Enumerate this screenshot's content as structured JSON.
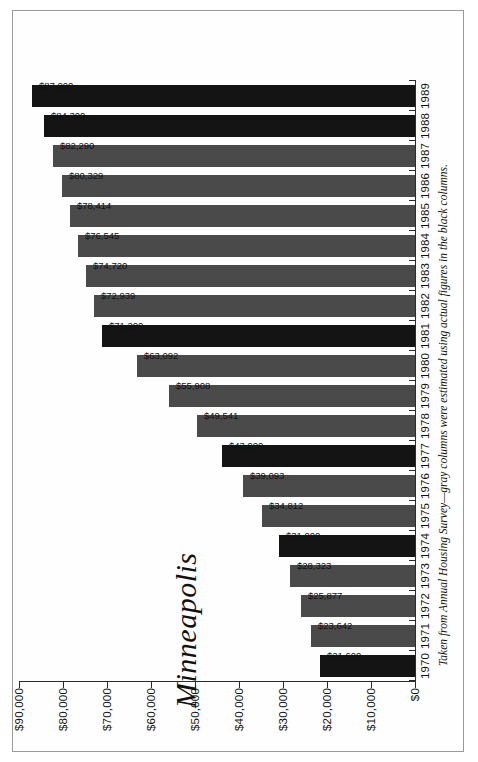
{
  "chart_data": {
    "type": "bar",
    "orientation": "vertical",
    "title": "Minneapolis",
    "xlabel": "",
    "ylabel": "",
    "ylim": [
      0,
      90000
    ],
    "grid": false,
    "legend": "none",
    "footnote": "Taken from Annual Housing Survey—gray columns were estimated using actual figures in the black columns.",
    "y_tick_labels": [
      "$90,000",
      "$80,000",
      "$70,000",
      "$60,000",
      "$50,000",
      "$40,000",
      "$30,000",
      "$20,000",
      "$10,000",
      "$0"
    ],
    "y_tick_values": [
      90000,
      80000,
      70000,
      60000,
      50000,
      40000,
      30000,
      20000,
      10000,
      0
    ],
    "categories": [
      "1970",
      "1971",
      "1972",
      "1973",
      "1974",
      "1975",
      "1976",
      "1977",
      "1978",
      "1979",
      "1980",
      "1981",
      "1982",
      "1983",
      "1984",
      "1985",
      "1986",
      "1987",
      "1988",
      "1989"
    ],
    "values": [
      21600,
      23642,
      25877,
      28323,
      31000,
      34812,
      39093,
      43900,
      49541,
      55908,
      63092,
      71200,
      72939,
      74720,
      76545,
      78414,
      80329,
      82290,
      84300,
      87000
    ],
    "value_labels": [
      "$21,600",
      "$23,642",
      "$25,877",
      "$28,323",
      "$31,000",
      "$34,812",
      "$39,093",
      "$43,900",
      "$49,541",
      "$55,908",
      "$63,092",
      "$71,200",
      "$72,939",
      "$74,720",
      "$76,545",
      "$78,414",
      "$80,329",
      "$82,290",
      "$84,300",
      "$87,000"
    ],
    "bar_kinds": [
      "actual",
      "estimated",
      "estimated",
      "estimated",
      "actual",
      "estimated",
      "estimated",
      "actual",
      "estimated",
      "estimated",
      "estimated",
      "actual",
      "estimated",
      "estimated",
      "estimated",
      "estimated",
      "estimated",
      "estimated",
      "actual",
      "actual"
    ],
    "colors": {
      "actual": "#141414",
      "estimated": "#4a4a4a",
      "axis": "#2b2b2b",
      "text": "#111111",
      "background": "#ffffff",
      "page_border": "#9a9a9a"
    }
  }
}
